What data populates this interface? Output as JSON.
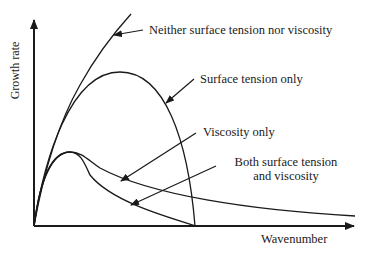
{
  "diagram": {
    "axes": {
      "x_label": "Wavenumber",
      "y_label": "Growth rate"
    },
    "curves": [
      {
        "id": "neither",
        "label": "Neither surface tension nor viscosity"
      },
      {
        "id": "surface_only",
        "label": "Surface tension only"
      },
      {
        "id": "viscosity_only",
        "label": "Viscosity only"
      },
      {
        "id": "both",
        "label_line1": "Both surface tension",
        "label_line2": "and viscosity"
      }
    ],
    "colors": {
      "line": "#1a1a1a",
      "background": "#ffffff"
    }
  }
}
